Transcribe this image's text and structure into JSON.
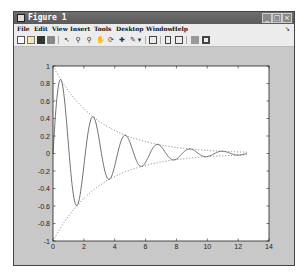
{
  "window": {
    "title": "Figure 1",
    "controls": [
      "minimize",
      "maximize",
      "close"
    ]
  },
  "menubar": {
    "items": [
      "File",
      "Edit",
      "View",
      "Insert",
      "Tools",
      "Desktop",
      "Window",
      "Help"
    ]
  },
  "toolbar": {
    "icons": [
      "new-figure",
      "open-file",
      "save",
      "print",
      "edit-plot",
      "zoom-in",
      "zoom-out",
      "pan",
      "rotate-3d",
      "data-cursor",
      "brush",
      "brush-dropdown",
      "link-plot",
      "insert-colorbar",
      "insert-legend",
      "hide-plot-tools",
      "show-plot-tools"
    ]
  },
  "chart_data": {
    "type": "line",
    "title": "",
    "xlabel": "",
    "ylabel": "",
    "xlim": [
      0,
      14
    ],
    "ylim": [
      -1,
      1
    ],
    "grid": false,
    "x_ticks": [
      "0",
      "2",
      "4",
      "6",
      "8",
      "10",
      "12",
      "14"
    ],
    "y_ticks": [
      "1",
      "0.8",
      "0.6",
      "0.4",
      "0.2",
      "0",
      "-0.2",
      "-0.4",
      "-0.6",
      "-0.8",
      "-1"
    ],
    "series": [
      {
        "name": "damped signal",
        "style": "solid",
        "formula": "exp(-t/3)*sin(3t)",
        "t_range": [
          0,
          12.57
        ],
        "sample_points": [
          [
            0,
            0
          ],
          [
            0.5,
            0.85
          ],
          [
            1.57,
            -0.59
          ],
          [
            2.62,
            0.42
          ],
          [
            3.67,
            -0.29
          ],
          [
            4.71,
            0.21
          ],
          [
            5.76,
            -0.15
          ],
          [
            6.81,
            0.1
          ],
          [
            7.85,
            -0.07
          ],
          [
            8.9,
            0.05
          ],
          [
            9.95,
            -0.04
          ],
          [
            11.0,
            0.03
          ],
          [
            12.57,
            0
          ]
        ]
      },
      {
        "name": "upper envelope",
        "style": "dotted",
        "formula": "exp(-t/3)",
        "t_range": [
          0,
          12.57
        ]
      },
      {
        "name": "lower envelope",
        "style": "dotted",
        "formula": "-exp(-t/3)",
        "t_range": [
          0,
          12.57
        ]
      }
    ]
  }
}
